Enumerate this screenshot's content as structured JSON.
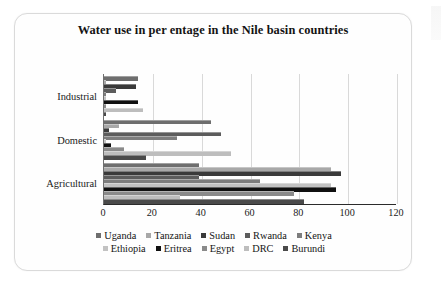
{
  "chart_data": {
    "type": "bar",
    "orientation": "horizontal",
    "title": "Water  use in per  entage in the Nile basin countries",
    "xlabel": "",
    "ylabel": "",
    "xlim": [
      0,
      120
    ],
    "xticks": [
      0,
      20,
      40,
      60,
      80,
      100,
      120
    ],
    "grid": true,
    "legend_position": "bottom",
    "categories": [
      "Industrial",
      "Domestic",
      "Agricultural"
    ],
    "series": [
      {
        "name": "Uganda",
        "color": "#6e6e6e",
        "values": [
          14,
          44,
          39
        ]
      },
      {
        "name": "Tanzania",
        "color": "#a8a8a8",
        "values": [
          1,
          6,
          93
        ]
      },
      {
        "name": "Sudan",
        "color": "#3a3a3a",
        "values": [
          13,
          2,
          97
        ]
      },
      {
        "name": "Rwanda",
        "color": "#5c5c5c",
        "values": [
          5,
          48,
          39
        ]
      },
      {
        "name": "Kenya",
        "color": "#7d7d7d",
        "values": [
          1,
          30,
          64
        ]
      },
      {
        "name": "Ethiopia",
        "color": "#c2c2c2",
        "values": [
          1,
          1,
          93
        ]
      },
      {
        "name": "Eritrea",
        "color": "#101010",
        "values": [
          14,
          3,
          95
        ]
      },
      {
        "name": "Egypt",
        "color": "#8a8a8a",
        "values": [
          1,
          8,
          78
        ]
      },
      {
        "name": "DRC",
        "color": "#bdbdbd",
        "values": [
          16,
          52,
          31
        ]
      },
      {
        "name": "Burundi",
        "color": "#4a4a4a",
        "values": [
          1,
          17,
          82
        ]
      }
    ]
  }
}
